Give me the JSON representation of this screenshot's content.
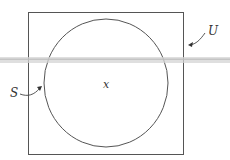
{
  "diagram": {
    "type": "venn",
    "universe_label": "U",
    "set_label": "S",
    "element_label": "x",
    "colors": {
      "stroke": "#555555",
      "band": "#cfcfcf",
      "background": "#ffffff"
    }
  }
}
